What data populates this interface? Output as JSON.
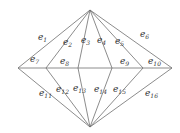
{
  "diagram": {
    "type": "planar-graph",
    "colors": {
      "edge": "#6e6e6e",
      "label": "#333333",
      "background": "#ffffff"
    },
    "vertices": {
      "top": [
        90,
        10
      ],
      "bottom": [
        90,
        127
      ],
      "left": [
        18,
        68
      ],
      "inner_left": [
        46,
        68
      ],
      "center_left": [
        78,
        68
      ],
      "center_right": [
        112,
        68
      ],
      "inner_right": [
        143,
        68
      ],
      "right": [
        172,
        68
      ]
    },
    "edges": [
      {
        "id": "e1",
        "from": "left",
        "to": "top",
        "label": {
          "base": "e",
          "sub": "1",
          "x": 38,
          "y": 40
        }
      },
      {
        "id": "e2",
        "from": "inner_left",
        "to": "top",
        "label": {
          "base": "e",
          "sub": "2",
          "x": 63,
          "y": 45
        }
      },
      {
        "id": "e3",
        "from": "center_left",
        "to": "top",
        "label": {
          "base": "e",
          "sub": "3",
          "x": 81,
          "y": 43
        }
      },
      {
        "id": "e4",
        "from": "center_right",
        "to": "top",
        "label": {
          "base": "e",
          "sub": "4",
          "x": 97,
          "y": 43
        }
      },
      {
        "id": "e5",
        "from": "inner_right",
        "to": "top",
        "label": {
          "base": "e",
          "sub": "5",
          "x": 115,
          "y": 44
        }
      },
      {
        "id": "e6",
        "from": "right",
        "to": "top",
        "label": {
          "base": "e",
          "sub": "6",
          "x": 140,
          "y": 37
        }
      },
      {
        "id": "e7",
        "from": "left",
        "to": "inner_left",
        "label": {
          "base": "e",
          "sub": "7",
          "x": 30,
          "y": 62
        }
      },
      {
        "id": "e8",
        "from": "inner_left",
        "to": "center_left",
        "label": {
          "base": "e",
          "sub": "8",
          "x": 60,
          "y": 64
        }
      },
      {
        "id": "e9",
        "from": "center_right",
        "to": "inner_right",
        "label": {
          "base": "e",
          "sub": "9",
          "x": 120,
          "y": 64
        }
      },
      {
        "id": "e10",
        "from": "inner_right",
        "to": "right",
        "label": {
          "base": "e",
          "sub": "10",
          "x": 148,
          "y": 64
        }
      },
      {
        "id": "e11",
        "from": "left",
        "to": "bottom",
        "label": {
          "base": "e",
          "sub": "11",
          "x": 39,
          "y": 96
        }
      },
      {
        "id": "e12",
        "from": "inner_left",
        "to": "bottom",
        "label": {
          "base": "e",
          "sub": "12",
          "x": 56,
          "y": 92
        }
      },
      {
        "id": "e13",
        "from": "center_left",
        "to": "bottom",
        "label": {
          "base": "e",
          "sub": "13",
          "x": 73,
          "y": 91
        }
      },
      {
        "id": "e14",
        "from": "center_right",
        "to": "bottom",
        "label": {
          "base": "e",
          "sub": "14",
          "x": 94,
          "y": 92
        }
      },
      {
        "id": "e15",
        "from": "inner_right",
        "to": "bottom",
        "label": {
          "base": "e",
          "sub": "15",
          "x": 113,
          "y": 92
        }
      },
      {
        "id": "e16",
        "from": "right",
        "to": "bottom",
        "label": {
          "base": "e",
          "sub": "16",
          "x": 145,
          "y": 96
        }
      }
    ],
    "extra_edges": [
      {
        "from": "center_left",
        "to": "center_right"
      }
    ]
  }
}
